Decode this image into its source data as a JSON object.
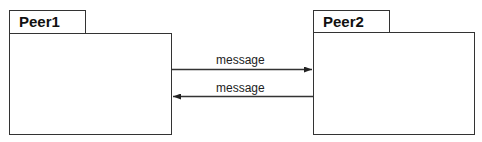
{
  "diagram": {
    "type": "uml-package-communication",
    "nodes": [
      {
        "id": "peer1",
        "label": "Peer1"
      },
      {
        "id": "peer2",
        "label": "Peer2"
      }
    ],
    "edges": [
      {
        "from": "peer1",
        "to": "peer2",
        "label": "message"
      },
      {
        "from": "peer2",
        "to": "peer1",
        "label": "message"
      }
    ],
    "colors": {
      "stroke": "#333333",
      "text": "#111111",
      "background": "#ffffff"
    }
  }
}
